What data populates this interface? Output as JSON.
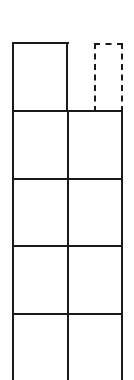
{
  "diagram": {
    "title": "",
    "stroke_color": "#1a1a1a",
    "background": "#ffffff",
    "columns": 2,
    "rows": 5,
    "top_row": {
      "left_cell": {
        "style": "solid"
      },
      "right_cell": {
        "style": "dashed"
      }
    }
  }
}
